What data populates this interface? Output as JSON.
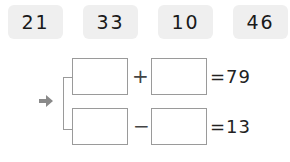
{
  "number_chips": [
    "21",
    "33",
    "10",
    "46"
  ],
  "equations": [
    {
      "operator": "+",
      "result_text": "=79",
      "blank_1": "",
      "blank_2": ""
    },
    {
      "operator": "−",
      "result_text": "=13",
      "blank_1": "",
      "blank_2": ""
    }
  ],
  "colors": {
    "chip_bg": "#efefef",
    "arrow": "#8a8a8a",
    "border": "#9a9a9a"
  },
  "icons": {
    "pointer": "arrow-right-icon"
  }
}
